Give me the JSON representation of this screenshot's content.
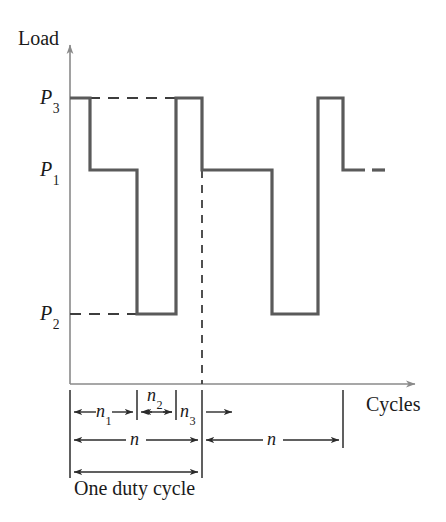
{
  "figure": {
    "axes": {
      "y_label": "Load",
      "x_label": "Cycles",
      "origin": {
        "x": 70,
        "y": 384
      },
      "y_arrow_top": 45,
      "x_arrow_right": 415
    },
    "levels": [
      {
        "name": "P3",
        "base": "P",
        "sub": "3",
        "y": 98
      },
      {
        "name": "P1",
        "base": "P",
        "sub": "1",
        "y": 170
      },
      {
        "name": "P2",
        "base": "P",
        "sub": "2",
        "y": 314
      }
    ],
    "waveform": {
      "stroke": "#5a5a5a",
      "width": 3,
      "segments": [
        {
          "level": "P3",
          "x0": 70,
          "x1": 90
        },
        {
          "level": "P1",
          "x0": 90,
          "x1": 137
        },
        {
          "level": "P2",
          "x0": 137,
          "x1": 176
        },
        {
          "level": "P3",
          "x0": 176,
          "x1": 202
        },
        {
          "level": "P1",
          "x0": 202,
          "x1": 272
        },
        {
          "level": "P2",
          "x0": 272,
          "x1": 318
        },
        {
          "level": "P3",
          "x0": 318,
          "x1": 343
        },
        {
          "level": "P1",
          "x0": 343,
          "x1": 365
        }
      ],
      "continuation_dash": {
        "level": "P1",
        "x0": 372,
        "x1": 385
      }
    },
    "guide_lines": [
      {
        "name": "p3-guide",
        "level": "P3",
        "x0": 70,
        "x1": 176,
        "style": "dashed"
      },
      {
        "name": "p2-guide",
        "level": "P2",
        "x0": 70,
        "x1": 137,
        "style": "dashed"
      },
      {
        "name": "cycle-divider",
        "x": 202,
        "y0": 170,
        "y1": 384,
        "style": "dashed"
      }
    ],
    "dimension_ticks": [
      70,
      137,
      176,
      202,
      343
    ],
    "dimensions": [
      {
        "id": "n1",
        "base": "n",
        "sub": "1",
        "x0": 70,
        "x1": 137,
        "row_y": 412,
        "label_y": 402,
        "arrows": "both"
      },
      {
        "id": "n2",
        "base": "n",
        "sub": "2",
        "x0": 137,
        "x1": 176,
        "row_y": 412,
        "label_y": 386,
        "arrows": "both"
      },
      {
        "id": "n3",
        "base": "n",
        "sub": "3",
        "x0": 176,
        "x1": 202,
        "row_y": 412,
        "label_y": 402,
        "arrows": "outward"
      },
      {
        "id": "n-first",
        "base": "n",
        "sub": "",
        "x0": 70,
        "x1": 202,
        "row_y": 440,
        "label_y": 430,
        "arrows": "both"
      },
      {
        "id": "n-second",
        "base": "n",
        "sub": "",
        "x0": 202,
        "x1": 343,
        "row_y": 440,
        "label_y": 430,
        "arrows": "both"
      },
      {
        "id": "duty",
        "base": "",
        "sub": "",
        "x0": 70,
        "x1": 202,
        "row_y": 472,
        "label_y": 478,
        "arrows": "both"
      }
    ],
    "duty_label": "One duty cycle",
    "colors": {
      "axis": "#8a8a8a",
      "waveform": "#5a5a5a",
      "dimension": "#2b2b2b",
      "text": "#1a1a1a",
      "background": "#ffffff"
    }
  }
}
